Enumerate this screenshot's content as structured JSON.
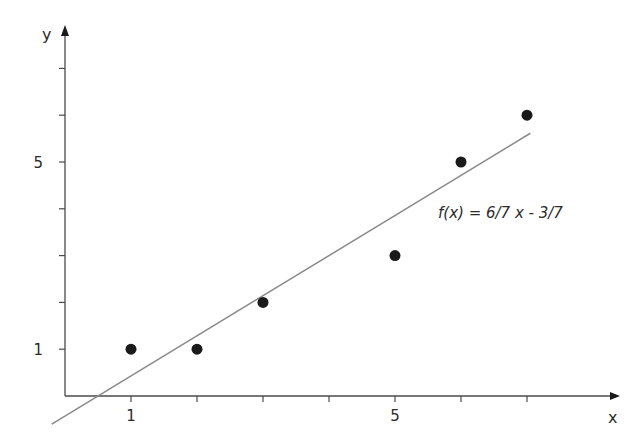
{
  "chart_data": {
    "type": "scatter",
    "title": "",
    "xlabel": "x",
    "ylabel": "y",
    "xlim": [
      0,
      8.3
    ],
    "ylim": [
      0,
      7.4
    ],
    "x_ticks": [
      1,
      2,
      3,
      4,
      5,
      6,
      7
    ],
    "y_ticks": [
      1,
      2,
      3,
      4,
      5,
      6,
      7
    ],
    "x_tick_labels": {
      "1": "1",
      "5": "5"
    },
    "y_tick_labels": {
      "1": "1",
      "5": "5"
    },
    "grid": false,
    "series": [
      {
        "name": "data points",
        "kind": "scatter",
        "x": [
          1,
          2,
          3,
          5,
          6,
          7
        ],
        "y": [
          1,
          1,
          2,
          3,
          5,
          6
        ],
        "color": "#1a1a1a"
      },
      {
        "name": "regression line",
        "kind": "line",
        "equation": "f(x) = 6/7 x - 3/7",
        "slope": 0.857142857,
        "intercept": -0.428571429,
        "x_range": [
          -0.2,
          7.05
        ],
        "color": "#8a8a8a"
      }
    ],
    "annotations": [
      {
        "text": "f(x) = 6/7 x - 3/7",
        "x": 4.6,
        "y": 2.8
      }
    ]
  },
  "labels": {
    "x_axis": "x",
    "y_axis": "y",
    "equation": "f(x) = 6/7 x - 3/7"
  }
}
